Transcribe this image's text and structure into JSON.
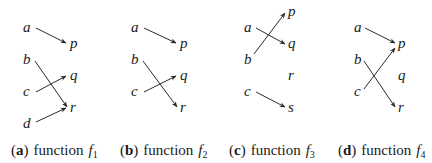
{
  "panels": [
    {
      "id": "a",
      "caption": {
        "open": "(",
        "letter": "a",
        "close": ")",
        "text": "function",
        "fname": "f",
        "sub": "1"
      },
      "domain_nodes": [
        "a",
        "b",
        "c",
        "d"
      ],
      "codomain_nodes": [
        "p",
        "q",
        "r"
      ],
      "mappings": [
        [
          "a",
          "p"
        ],
        [
          "b",
          "r"
        ],
        [
          "c",
          "q"
        ],
        [
          "d",
          "r"
        ]
      ]
    },
    {
      "id": "b",
      "caption": {
        "open": "(",
        "letter": "b",
        "close": ")",
        "text": "function",
        "fname": "f",
        "sub": "2"
      },
      "domain_nodes": [
        "a",
        "b",
        "c"
      ],
      "codomain_nodes": [
        "p",
        "q",
        "r"
      ],
      "mappings": [
        [
          "a",
          "p"
        ],
        [
          "b",
          "r"
        ],
        [
          "c",
          "q"
        ]
      ]
    },
    {
      "id": "c",
      "caption": {
        "open": "(",
        "letter": "c",
        "close": ")",
        "text": "function",
        "fname": "f",
        "sub": "3"
      },
      "domain_nodes": [
        "a",
        "b",
        "c"
      ],
      "codomain_nodes": [
        "p",
        "q",
        "r",
        "s"
      ],
      "mappings": [
        [
          "a",
          "q"
        ],
        [
          "b",
          "p"
        ],
        [
          "c",
          "s"
        ]
      ]
    },
    {
      "id": "d",
      "caption": {
        "open": "(",
        "letter": "d",
        "close": ")",
        "text": "function",
        "fname": "f",
        "sub": "4"
      },
      "domain_nodes": [
        "a",
        "b",
        "c"
      ],
      "codomain_nodes": [
        "p",
        "q",
        "r"
      ],
      "mappings": [
        [
          "a",
          "p"
        ],
        [
          "b",
          "r"
        ],
        [
          "c",
          "p"
        ]
      ]
    }
  ]
}
